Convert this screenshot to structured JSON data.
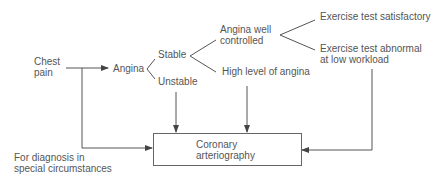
{
  "diagram": {
    "nodes": {
      "chest_pain": [
        "Chest",
        "pain"
      ],
      "angina": "Angina",
      "stable": "Stable",
      "unstable": "Unstable",
      "angina_well_controlled": [
        "Angina well",
        "controlled"
      ],
      "high_level_angina": "High level of angina",
      "exercise_satisfactory": "Exercise test satisfactory",
      "exercise_abnormal": [
        "Exercise test abnormal",
        "at low workload"
      ],
      "coronary_arteriography": [
        "Coronary",
        "arteriography"
      ],
      "special_circumstances": [
        "For diagnosis in",
        "special circumstances"
      ]
    },
    "colors": {
      "line": "#555555",
      "text": "#555555"
    }
  }
}
